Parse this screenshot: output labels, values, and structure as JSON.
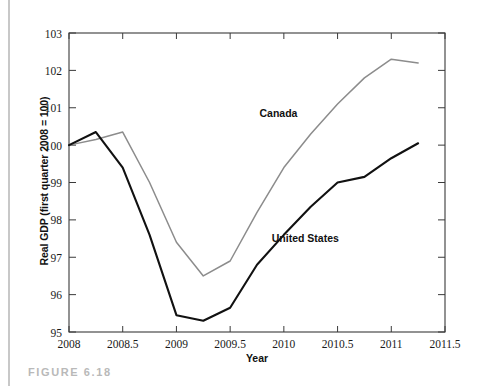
{
  "figure": {
    "caption": "FIGURE 6.18"
  },
  "chart_data": {
    "type": "line",
    "title": "",
    "xlabel": "Year",
    "ylabel": "Real GDP (first quarter 2008 = 100)",
    "xlim": [
      2008,
      2011.5
    ],
    "ylim": [
      95,
      103
    ],
    "grid": false,
    "legend_position": "inline-annotations",
    "xticks": [
      2008,
      2008.5,
      2009,
      2009.5,
      2010,
      2010.5,
      2011,
      2011.5
    ],
    "xtick_labels": [
      "2008",
      "2008.5",
      "2009",
      "2009.5",
      "2010",
      "2010.5",
      "2011",
      "2011.5"
    ],
    "yticks": [
      95,
      96,
      97,
      98,
      99,
      100,
      101,
      102,
      103
    ],
    "ytick_labels": [
      "95",
      "96",
      "97",
      "98",
      "99",
      "100",
      "101",
      "102",
      "103"
    ],
    "x": [
      2008,
      2008.25,
      2008.5,
      2008.75,
      2009,
      2009.25,
      2009.5,
      2009.75,
      2010,
      2010.25,
      2010.5,
      2010.75,
      2011,
      2011.25
    ],
    "series": [
      {
        "name": "Canada",
        "color": "#8c8c8c",
        "values": [
          100.0,
          100.15,
          100.35,
          99.0,
          97.4,
          96.5,
          96.9,
          98.2,
          99.4,
          100.3,
          101.1,
          101.8,
          102.3,
          102.2
        ]
      },
      {
        "name": "United States",
        "color": "#111111",
        "values": [
          100.0,
          100.35,
          99.4,
          97.6,
          95.45,
          95.3,
          95.65,
          96.8,
          97.6,
          98.35,
          99.0,
          99.15,
          99.65,
          100.05
        ]
      }
    ],
    "annotations": [
      {
        "text": "Canada",
        "x": 2009.95,
        "y": 100.75
      },
      {
        "text": "United States",
        "x": 2010.2,
        "y": 97.4
      }
    ]
  }
}
